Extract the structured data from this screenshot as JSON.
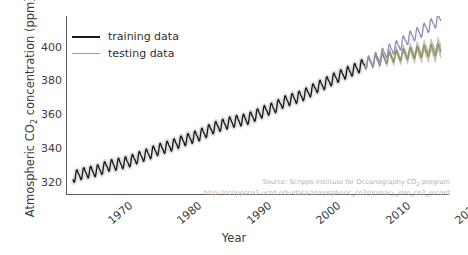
{
  "axes": {
    "ylabel": "Atmospheric CO2 concentration (ppm)",
    "ylabel_pre": "Atmospheric CO",
    "ylabel_sub": "2",
    "ylabel_post": " concentration (ppm)",
    "xlabel": "Year",
    "yticks": [
      "320",
      "340",
      "360",
      "380",
      "400"
    ],
    "xticks": [
      "1970",
      "1980",
      "1990",
      "2000",
      "2010",
      "2020"
    ]
  },
  "legend": {
    "items": [
      {
        "label": "training data",
        "color": "#1a1a1a"
      },
      {
        "label": "testing data",
        "color": "#9a9ac4"
      }
    ]
  },
  "annotation": {
    "line1_pre": "Source: Scripps Institute for Oceanography CO",
    "line1_sub": "2",
    "line1_post": " program",
    "line2": "http://scrippsco2.ucsd.edu/data/atmospheric_co2/primary_mlo_co2_record"
  },
  "colors": {
    "training": "#1a1a1a",
    "testing": "#8f8fbf",
    "prediction_band": "#8d8d6a",
    "band_fill": "#b9b9a4",
    "axis": "#5a5a5a",
    "text": "#3b3b3b",
    "annotation": "#b2b2b2",
    "background": "#ffffff"
  },
  "chart_data": {
    "type": "line",
    "title": "",
    "xlabel": "Year",
    "ylabel": "Atmospheric CO2 concentration (ppm)",
    "xlim": [
      1967,
      2022
    ],
    "ylim": [
      313,
      418
    ],
    "grid": false,
    "legend_position": "upper left",
    "series": [
      {
        "name": "training data",
        "color": "#1a1a1a",
        "x": [
          1968,
          1969,
          1970,
          1971,
          1972,
          1973,
          1974,
          1975,
          1976,
          1977,
          1978,
          1979,
          1980,
          1981,
          1982,
          1983,
          1984,
          1985,
          1986,
          1987,
          1988,
          1989,
          1990,
          1991,
          1992,
          1993,
          1994,
          1995,
          1996,
          1997,
          1998,
          1999,
          2000,
          2001,
          2002,
          2003,
          2004,
          2005,
          2006,
          2007,
          2008,
          2009,
          2010
        ],
        "values": [
          323.0,
          324.6,
          325.7,
          326.3,
          327.5,
          329.7,
          330.2,
          331.1,
          332.0,
          333.8,
          335.4,
          336.8,
          338.8,
          340.1,
          341.4,
          343.0,
          344.6,
          346.0,
          347.4,
          349.2,
          351.6,
          353.1,
          354.4,
          355.6,
          356.4,
          357.1,
          358.8,
          360.8,
          362.6,
          363.8,
          366.6,
          368.3,
          369.5,
          371.0,
          373.2,
          375.8,
          377.5,
          379.8,
          381.9,
          383.8,
          385.6,
          387.4,
          389.9
        ],
        "seasonal_amplitude": 3.0
      },
      {
        "name": "testing data",
        "color": "#8f8fbf",
        "x": [
          2010,
          2011,
          2012,
          2013,
          2014,
          2015,
          2016,
          2017,
          2018,
          2019,
          2020,
          2021
        ],
        "values": [
          389.9,
          391.7,
          393.9,
          396.5,
          398.7,
          400.8,
          404.2,
          406.6,
          408.5,
          411.4,
          414.0,
          416.4
        ],
        "seasonal_amplitude": 3.2
      },
      {
        "name": "prediction band",
        "color": "#8d8d6a",
        "x": [
          2010,
          2011,
          2012,
          2013,
          2014,
          2015,
          2016,
          2017,
          2018,
          2019,
          2020,
          2021
        ],
        "values": [
          389.9,
          391.0,
          392.1,
          393.1,
          394.0,
          394.8,
          395.6,
          396.3,
          396.9,
          397.4,
          397.9,
          398.3
        ],
        "band_halfwidth": [
          0.8,
          1.2,
          1.6,
          2.0,
          2.4,
          2.7,
          3.0,
          3.3,
          3.6,
          3.9,
          4.2,
          4.5
        ],
        "seasonal_amplitude": 3.0
      }
    ]
  }
}
